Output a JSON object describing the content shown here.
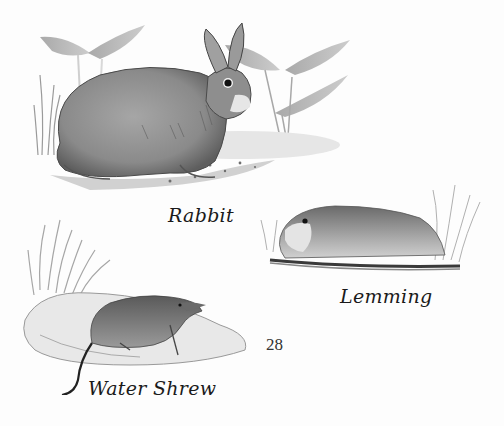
{
  "page": {
    "page_number": "28",
    "background": "#fdfdfd"
  },
  "illustrations": [
    {
      "id": "rabbit",
      "caption": "Rabbit",
      "description": "Pencil and watercolor drawing of a grey rabbit sitting on ground, with leafy plants behind"
    },
    {
      "id": "lemming",
      "caption": "Lemming",
      "description": "Drawing of a lemming lying flat on a grassy patch with tall grass at right"
    },
    {
      "id": "water-shrew",
      "caption": "Water Shrew",
      "description": "Drawing of a water shrew on a mound of earth with grass tufts behind"
    }
  ],
  "colors": {
    "ink": "#1a1a1a",
    "fur_mid": "#8a8a8a",
    "fur_dark": "#555555",
    "ground": "#c8c8c8"
  }
}
